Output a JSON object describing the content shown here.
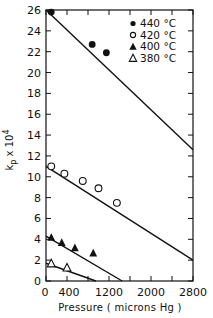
{
  "chart_data": {
    "type": "scatter",
    "title": "",
    "xlabel": "Pressure ( microns Hg )",
    "ylabel": "k_p x 10^4",
    "ylabel_main": "k",
    "ylabel_sub": "p",
    "ylabel_rest": " x 10",
    "ylabel_sup": "4",
    "xlim": [
      0,
      2800
    ],
    "ylim": [
      0,
      26
    ],
    "xticks": [
      0,
      400,
      1200,
      2000,
      2800
    ],
    "xtick_labels": [
      "0",
      "400",
      "1200",
      "2000",
      "2800"
    ],
    "xticks_minor": [
      800,
      1600,
      2400
    ],
    "yticks": [
      0,
      2,
      4,
      6,
      8,
      10,
      12,
      14,
      16,
      18,
      20,
      22,
      24,
      26
    ],
    "ytick_labels": [
      "0",
      "2",
      "4",
      "6",
      "8",
      "10",
      "12",
      "14",
      "16",
      "18",
      "20",
      "22",
      "24",
      "26"
    ],
    "grid": false,
    "legend_position": "upper right",
    "series": [
      {
        "name": "440 °C",
        "marker": "filled-circle",
        "points": [
          [
            100,
            25.8
          ],
          [
            880,
            22.7
          ],
          [
            1150,
            21.9
          ]
        ],
        "fit_line": [
          [
            0,
            26.0
          ],
          [
            2800,
            12.6
          ]
        ]
      },
      {
        "name": "420 °C",
        "marker": "open-circle",
        "points": [
          [
            100,
            11.0
          ],
          [
            350,
            10.3
          ],
          [
            700,
            9.6
          ],
          [
            1000,
            8.9
          ],
          [
            1350,
            7.5
          ]
        ],
        "fit_line": [
          [
            0,
            11.0
          ],
          [
            2800,
            2.0
          ]
        ]
      },
      {
        "name": "400 °C",
        "marker": "filled-triangle",
        "points": [
          [
            100,
            4.2
          ],
          [
            300,
            3.7
          ],
          [
            550,
            3.2
          ],
          [
            900,
            2.7
          ]
        ],
        "fit_line": [
          [
            0,
            4.3
          ],
          [
            1450,
            0
          ]
        ]
      },
      {
        "name": "380 °C",
        "marker": "open-triangle",
        "points": [
          [
            100,
            1.7
          ],
          [
            400,
            1.3
          ]
        ],
        "fit_line": [
          [
            0,
            1.7
          ],
          [
            950,
            0
          ]
        ]
      }
    ]
  },
  "legend": {
    "items": [
      {
        "label": "440 °C",
        "marker": "filled-circle"
      },
      {
        "label": "420 °C",
        "marker": "open-circle"
      },
      {
        "label": "400 °C",
        "marker": "filled-triangle"
      },
      {
        "label": "380 °C",
        "marker": "open-triangle"
      }
    ]
  }
}
